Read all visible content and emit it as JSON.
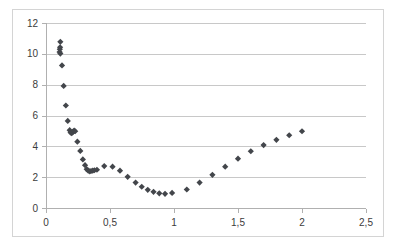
{
  "chart_data": {
    "type": "scatter",
    "title": "",
    "subtitle": "",
    "xlabel": "",
    "ylabel": "",
    "xlim": [
      0,
      2.5
    ],
    "ylim": [
      0,
      12
    ],
    "grid": true,
    "legend": false,
    "legend_position": "none",
    "marker": "diamond",
    "marker_color": "#43464b",
    "gridline_color": "#c8c8c8",
    "border_color": "#d4d4d4",
    "x_ticks": [
      0,
      0.5,
      1,
      1.5,
      2,
      2.5
    ],
    "x_tick_labels": [
      "0",
      "0,5",
      "1",
      "1,5",
      "2",
      "2,5"
    ],
    "y_ticks": [
      0,
      2,
      4,
      6,
      8,
      10,
      12
    ],
    "y_tick_labels": [
      "0",
      "2",
      "4",
      "6",
      "8",
      "10",
      "12"
    ],
    "decimal_separator": ",",
    "series": [
      {
        "name": "series-1",
        "points": [
          [
            0.112,
            10.78
          ],
          [
            0.11,
            10.42
          ],
          [
            0.108,
            10.3
          ],
          [
            0.106,
            10.12
          ],
          [
            0.112,
            10.02
          ],
          [
            0.125,
            9.25
          ],
          [
            0.138,
            7.92
          ],
          [
            0.155,
            6.65
          ],
          [
            0.17,
            5.65
          ],
          [
            0.185,
            5.05
          ],
          [
            0.192,
            4.92
          ],
          [
            0.198,
            4.85
          ],
          [
            0.205,
            4.88
          ],
          [
            0.212,
            4.95
          ],
          [
            0.22,
            5.02
          ],
          [
            0.228,
            4.98
          ],
          [
            0.245,
            4.3
          ],
          [
            0.268,
            3.7
          ],
          [
            0.288,
            3.15
          ],
          [
            0.305,
            2.78
          ],
          [
            0.318,
            2.52
          ],
          [
            0.33,
            2.42
          ],
          [
            0.342,
            2.38
          ],
          [
            0.352,
            2.4
          ],
          [
            0.365,
            2.42
          ],
          [
            0.378,
            2.45
          ],
          [
            0.398,
            2.48
          ],
          [
            0.455,
            2.72
          ],
          [
            0.52,
            2.68
          ],
          [
            0.578,
            2.42
          ],
          [
            0.638,
            2.02
          ],
          [
            0.7,
            1.65
          ],
          [
            0.748,
            1.38
          ],
          [
            0.795,
            1.18
          ],
          [
            0.84,
            1.05
          ],
          [
            0.885,
            0.95
          ],
          [
            0.93,
            0.92
          ],
          [
            0.985,
            0.98
          ],
          [
            1.1,
            1.2
          ],
          [
            1.2,
            1.65
          ],
          [
            1.3,
            2.15
          ],
          [
            1.4,
            2.68
          ],
          [
            1.5,
            3.2
          ],
          [
            1.6,
            3.68
          ],
          [
            1.7,
            4.08
          ],
          [
            1.8,
            4.42
          ],
          [
            1.9,
            4.72
          ],
          [
            2.0,
            4.98
          ]
        ]
      }
    ]
  }
}
